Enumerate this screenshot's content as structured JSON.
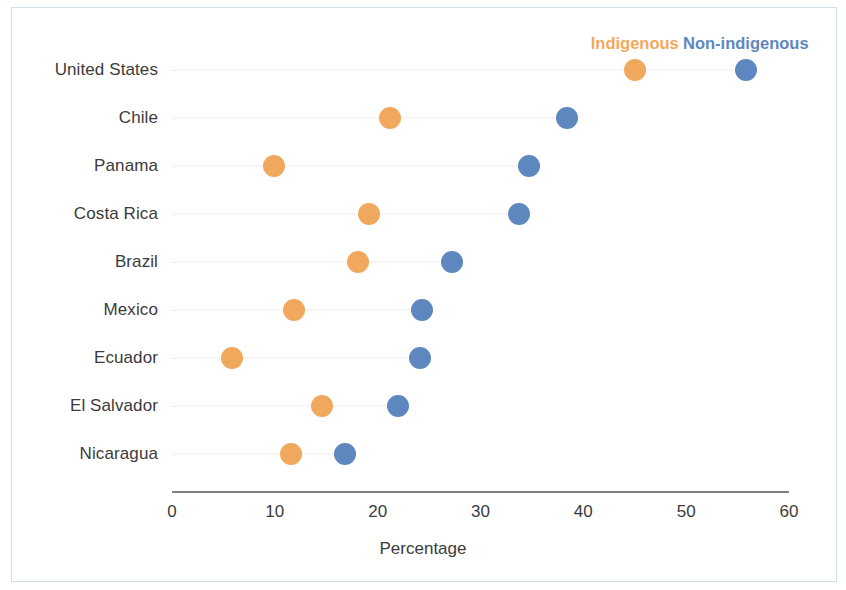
{
  "chart_data": {
    "type": "scatter",
    "subtype": "dumbbell",
    "title": "",
    "xlabel": "Percentage",
    "ylabel": "",
    "xlim": [
      0,
      60
    ],
    "xticks": [
      0,
      10,
      20,
      30,
      40,
      50,
      60
    ],
    "xtick_labels": [
      "0",
      "10",
      "20",
      "30",
      "40",
      "50",
      "60"
    ],
    "grid": false,
    "legend_position": "top-right",
    "categories": [
      "United States",
      "Chile",
      "Panama",
      "Costa Rica",
      "Brazil",
      "Mexico",
      "Ecuador",
      "El Salvador",
      "Nicaragua"
    ],
    "series": [
      {
        "name": "Indigenous",
        "color": "#f0a95c",
        "values": [
          45.0,
          21.2,
          9.9,
          19.2,
          18.1,
          11.9,
          5.8,
          14.6,
          11.6
        ]
      },
      {
        "name": "Non-indigenous",
        "color": "#5e87bf",
        "values": [
          55.8,
          38.4,
          34.7,
          33.7,
          27.2,
          24.3,
          24.1,
          22.0,
          16.8
        ]
      }
    ]
  },
  "legend": {
    "items": [
      {
        "label": "Indigenous",
        "color": "#f0a95c"
      },
      {
        "label": "Non-indigenous",
        "color": "#5e87bf"
      }
    ]
  },
  "axis": {
    "x_title": "Percentage"
  },
  "colors": {
    "indigenous": "#f0a95c",
    "non_indigenous": "#5e87bf",
    "axis_line": "#808080",
    "connector": "#dcdcdc",
    "text": "#3b3b3b",
    "frame": "#cfe0ea",
    "background": "#ffffff"
  }
}
